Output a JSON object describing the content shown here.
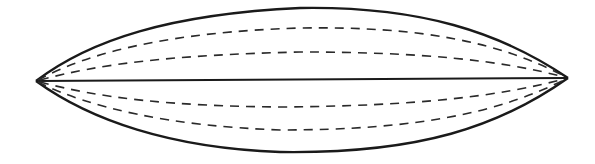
{
  "diagram": {
    "colors": {
      "background": "#ffffff",
      "stroke": "#1a1a1a"
    },
    "tips": {
      "left": [
        36,
        81
      ],
      "right": [
        568,
        78
      ]
    },
    "outline": {
      "top_peak_y": 8,
      "bottom_peak_y": 152
    },
    "center_axis_y": 80,
    "dashed_lines": {
      "upper": [
        29,
        53
      ],
      "lower": [
        106,
        129
      ]
    }
  }
}
